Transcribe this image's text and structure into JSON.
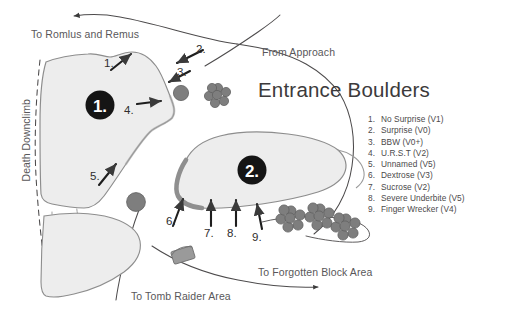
{
  "title": "Entrance Boulders",
  "colors": {
    "background": "#ffffff",
    "boulder_fill": "#ececec",
    "boulder_stroke": "#8a8a8a",
    "boulder_shadow": "#9a9a9a",
    "rock_gray": "#7d7d7d",
    "marker_black": "#151515",
    "trail": "#4a4a4a",
    "text": "#4b494a",
    "title_text": "#3c3a3b"
  },
  "trail_labels": {
    "to_romlus": "To Romlus and Remus",
    "from_approach": "From Approach",
    "death_downclimb": "Death Downclimb",
    "to_tomb_raider": "To Tomb Raider Area",
    "to_forgotten_block": "To Forgotten Block Area"
  },
  "boulder_markers": [
    {
      "id": "boulder-1",
      "label": "1."
    },
    {
      "id": "boulder-2",
      "label": "2."
    }
  ],
  "arrow_callouts": [
    {
      "num": "1.",
      "direction": "up-right"
    },
    {
      "num": "2.",
      "direction": "down-left"
    },
    {
      "num": "3.",
      "direction": "down-left"
    },
    {
      "num": "4.",
      "direction": "right"
    },
    {
      "num": "5.",
      "direction": "up-right"
    },
    {
      "num": "6.",
      "direction": "up"
    },
    {
      "num": "7.",
      "direction": "up"
    },
    {
      "num": "8.",
      "direction": "up"
    },
    {
      "num": "9.",
      "direction": "up"
    }
  ],
  "legend": {
    "items": [
      {
        "index": "1.",
        "name": "No Surprise (V1)"
      },
      {
        "index": "2.",
        "name": "Surprise (V0)"
      },
      {
        "index": "3.",
        "name": "BBW (V0+)"
      },
      {
        "index": "4.",
        "name": "U.R.S.T (V2)"
      },
      {
        "index": "5.",
        "name": "Unnamed (V5)"
      },
      {
        "index": "6.",
        "name": "Dextrose (V3)"
      },
      {
        "index": "7.",
        "name": "Sucrose (V2)"
      },
      {
        "index": "8.",
        "name": "Severe Underbite (V5)"
      },
      {
        "index": "9.",
        "name": "Finger Wrecker (V4)"
      }
    ]
  }
}
